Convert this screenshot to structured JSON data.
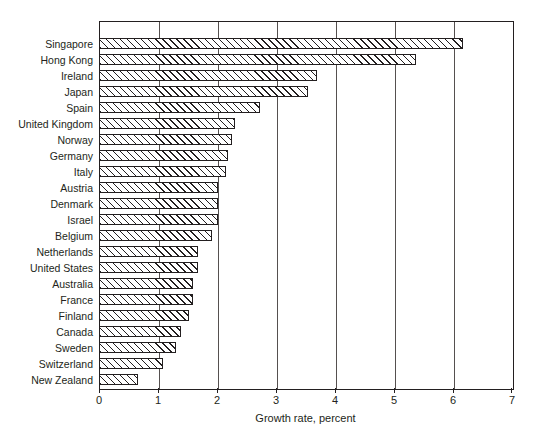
{
  "chart_data": {
    "type": "bar",
    "orientation": "horizontal",
    "title": "",
    "xlabel": "Growth rate, percent",
    "ylabel": "",
    "xlim": [
      0,
      7
    ],
    "ylim": null,
    "grid": true,
    "legend": null,
    "xticks": [
      0,
      1,
      2,
      3,
      4,
      5,
      6,
      7
    ],
    "xticklabels": [
      "0",
      "1",
      "2",
      "3",
      "4",
      "5",
      "6",
      "7"
    ],
    "categories": [
      "Singapore",
      "Hong Kong",
      "Ireland",
      "Japan",
      "Spain",
      "United Kingdom",
      "Norway",
      "Germany",
      "Italy",
      "Austria",
      "Denmark",
      "Israel",
      "Belgium",
      "Netherlands",
      "United States",
      "Australia",
      "France",
      "Finland",
      "Canada",
      "Sweden",
      "Switzerland",
      "New Zealand"
    ],
    "values": [
      6.17,
      5.37,
      3.69,
      3.54,
      2.73,
      2.3,
      2.25,
      2.19,
      2.15,
      2.02,
      2.02,
      2.02,
      1.92,
      1.68,
      1.68,
      1.6,
      1.6,
      1.53,
      1.39,
      1.31,
      1.08,
      0.66
    ],
    "bar_style": {
      "fill": "#ffffff",
      "hatch": "forward-diagonal",
      "edge_color": "#231f20"
    }
  }
}
